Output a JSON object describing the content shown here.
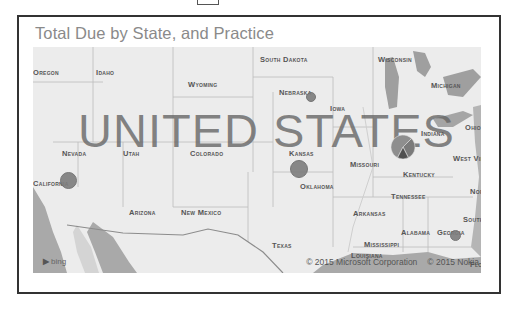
{
  "visual": {
    "title": "Total Due by State, and Practice",
    "country_label": "UNITED STATES",
    "attribution": {
      "logo": "bing",
      "copyright_microsoft": "© 2015 Microsoft Corporation",
      "copyright_nokia": "© 2015 Nokia"
    }
  },
  "map": {
    "state_labels": [
      {
        "name": "Oregon",
        "x": 0,
        "y": 21
      },
      {
        "name": "Idaho",
        "x": 63,
        "y": 21
      },
      {
        "name": "Wyoming",
        "x": 155,
        "y": 33
      },
      {
        "name": "South Dakota",
        "x": 227,
        "y": 8
      },
      {
        "name": "Wisconsin",
        "x": 345,
        "y": 8
      },
      {
        "name": "Michigan",
        "x": 398,
        "y": 34
      },
      {
        "name": "Iowa",
        "x": 297,
        "y": 57
      },
      {
        "name": "Nebraska",
        "x": 246,
        "y": 41
      },
      {
        "name": "Indiana",
        "x": 388,
        "y": 82
      },
      {
        "name": "Ohio",
        "x": 432,
        "y": 76
      },
      {
        "name": "Nevada",
        "x": 29,
        "y": 102
      },
      {
        "name": "Utah",
        "x": 90,
        "y": 102
      },
      {
        "name": "Colorado",
        "x": 157,
        "y": 102
      },
      {
        "name": "Kansas",
        "x": 256,
        "y": 102
      },
      {
        "name": "Missouri",
        "x": 317,
        "y": 113
      },
      {
        "name": "West Virginia",
        "x": 420,
        "y": 107
      },
      {
        "name": "Kentucky",
        "x": 370,
        "y": 123
      },
      {
        "name": "California",
        "x": 0,
        "y": 132
      },
      {
        "name": "Oklahoma",
        "x": 267,
        "y": 135
      },
      {
        "name": "Tennessee",
        "x": 358,
        "y": 145
      },
      {
        "name": "Arizona",
        "x": 96,
        "y": 161
      },
      {
        "name": "New Mexico",
        "x": 148,
        "y": 161
      },
      {
        "name": "Arkansas",
        "x": 320,
        "y": 162
      },
      {
        "name": "Alabama",
        "x": 368,
        "y": 181
      },
      {
        "name": "Georgia",
        "x": 404,
        "y": 181
      },
      {
        "name": "South Carolina",
        "x": 430,
        "y": 168
      },
      {
        "name": "North Carolina",
        "x": 437,
        "y": 140
      },
      {
        "name": "Texas",
        "x": 239,
        "y": 194
      },
      {
        "name": "Mississippi",
        "x": 331,
        "y": 193
      },
      {
        "name": "Louisiana",
        "x": 318,
        "y": 204
      },
      {
        "name": "Florida",
        "x": 437,
        "y": 213
      }
    ],
    "markers": [
      {
        "state": "California",
        "type": "circle",
        "x": 27,
        "y": 125,
        "size": 15
      },
      {
        "state": "Nebraska",
        "type": "circle",
        "x": 273,
        "y": 45,
        "size": 8
      },
      {
        "state": "Kansas",
        "type": "circle",
        "x": 257,
        "y": 113,
        "size": 16
      },
      {
        "state": "Georgia",
        "type": "circle",
        "x": 417,
        "y": 183,
        "size": 9
      },
      {
        "state": "Illinois",
        "type": "pie",
        "x": 357,
        "y": 87,
        "size": 24,
        "slices": [
          {
            "label": "Practice A",
            "share": 0.55,
            "color": "#8e8e8e"
          },
          {
            "label": "Practice B",
            "share": 0.3,
            "color": "#7a7a7a"
          },
          {
            "label": "Practice C",
            "share": 0.15,
            "color": "#4f4f4f"
          }
        ]
      }
    ]
  }
}
